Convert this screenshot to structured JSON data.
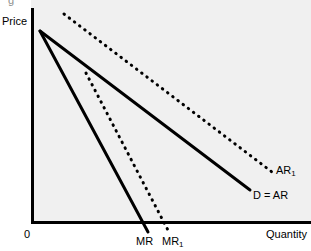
{
  "figure": {
    "background_color": "#ffffff",
    "plot_background_color": "#f0f0f0",
    "axis_color": "#000000",
    "line_color": "#000000",
    "top_cropped_fragment": "g"
  },
  "axes": {
    "y_label": "Price",
    "x_label": "Quantity",
    "origin_label": "0"
  },
  "curve_labels": {
    "mr": "MR",
    "mr1_base": "MR",
    "mr1_sub": "1",
    "ar1_base": "AR",
    "ar1_sub": "1",
    "d_ar": "D = AR"
  },
  "chart_data": {
    "type": "line",
    "title": "",
    "xlabel": "Quantity",
    "ylabel": "Price",
    "grid": false,
    "legend": "inline-end-labels",
    "axis_origin_label": "0",
    "xlim": [
      0,
      1
    ],
    "ylim": [
      0,
      1
    ],
    "note": "Monopoly demand/marginal-revenue shift diagram. Coordinates are in figure pixel space (311x251); plot origin at (31,223).",
    "series": [
      {
        "name": "D = AR",
        "style": "solid",
        "label": "D = AR",
        "label_position": {
          "x": 253,
          "y": 189
        },
        "points": [
          {
            "x": 40,
            "y": 31
          },
          {
            "x": 250,
            "y": 190
          }
        ]
      },
      {
        "name": "MR",
        "style": "solid",
        "label": "MR",
        "label_position": {
          "x": 136,
          "y": 235
        },
        "points": [
          {
            "x": 40,
            "y": 31
          },
          {
            "x": 148,
            "y": 232
          }
        ]
      },
      {
        "name": "AR1",
        "style": "dotted",
        "label": "AR₁",
        "label_position": {
          "x": 276,
          "y": 164
        },
        "points": [
          {
            "x": 64,
            "y": 14
          },
          {
            "x": 272,
            "y": 172
          }
        ]
      },
      {
        "name": "MR1",
        "style": "dotted",
        "label": "MR₁",
        "label_position": {
          "x": 162,
          "y": 235
        },
        "points": [
          {
            "x": 86,
            "y": 73
          },
          {
            "x": 170,
            "y": 234
          }
        ]
      }
    ]
  }
}
